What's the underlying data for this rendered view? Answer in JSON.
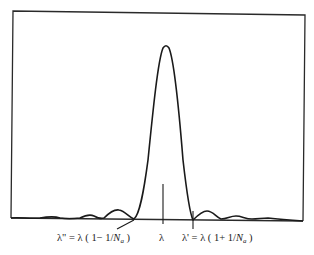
{
  "figure": {
    "colors": {
      "line": "#1a1a1a",
      "background": "#ffffff"
    }
  },
  "labels": {
    "left_min": {
      "prefix": "λ\" = λ ( 1− 1/",
      "var": "N",
      "sub": "a",
      "suffix": " )"
    },
    "center": {
      "text": "λ"
    },
    "right_min": {
      "prefix": "λ' = λ ( 1+ 1/",
      "var": "N",
      "sub": "a",
      "suffix": " )"
    }
  }
}
